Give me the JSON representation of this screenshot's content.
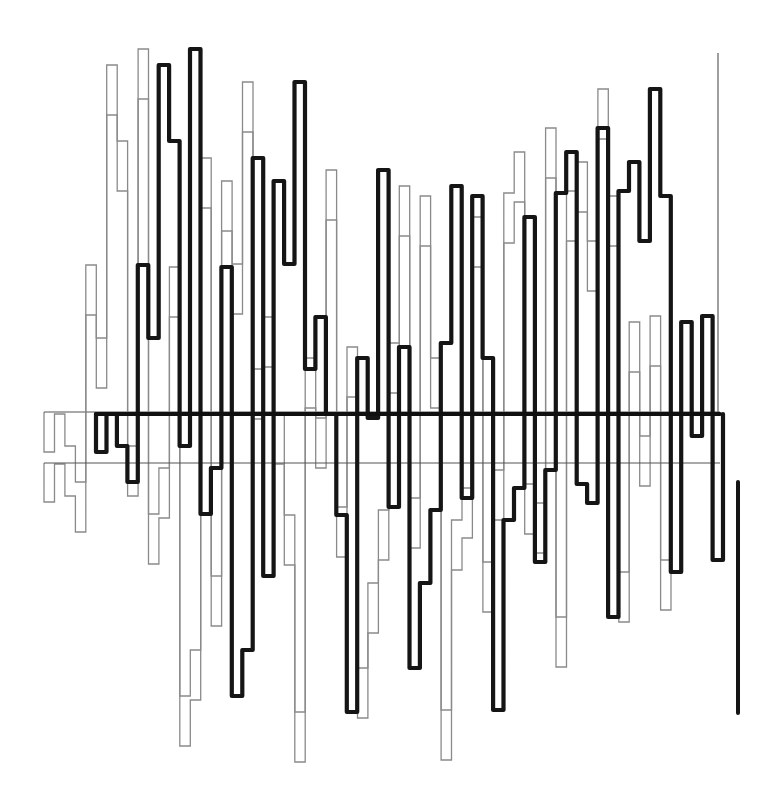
{
  "artwork": {
    "title": "",
    "background": "#ffffff",
    "colors": {
      "primary_trace": "#151515",
      "echo_trace": "#8a8a8a",
      "guide_line": "#6a6a6a"
    }
  },
  "chart_data": {
    "type": "line",
    "title": "",
    "xlabel": "",
    "ylabel": "",
    "grid": false,
    "legend": null,
    "step": true,
    "column_width_px": 10.45,
    "series": [
      {
        "name": "primary",
        "style": "thick-black",
        "x_start_px": 96,
        "baseline_y_px": 414,
        "end_x_px": 720,
        "values_y_px": [
          452,
          414,
          446,
          482,
          265,
          338,
          65,
          141,
          446,
          49,
          514,
          468,
          267,
          696,
          650,
          158,
          576,
          181,
          264,
          82,
          369,
          317,
          414,
          515,
          712,
          358,
          418,
          170,
          507,
          347,
          668,
          583,
          510,
          343,
          186,
          498,
          196,
          358,
          710,
          520,
          488,
          217,
          562,
          470,
          193,
          152,
          484,
          503,
          128,
          617,
          191,
          162,
          241,
          89,
          196,
          572,
          322,
          436,
          316,
          560
        ]
      },
      {
        "name": "echo-a",
        "style": "thin-gray",
        "x_start_px": 44,
        "baseline_y_px": 412,
        "x_shift_px": -52,
        "y_shift_px": 0,
        "end_x_px": 720
      },
      {
        "name": "echo-b",
        "style": "thin-gray",
        "x_start_px": 44,
        "baseline_y_px": 463,
        "x_shift_px": -52,
        "y_shift_px": 50,
        "end_x_px": 720
      }
    ],
    "extras": {
      "right_guide_line": {
        "x_px": 718,
        "y_top_px": 53,
        "y_bottom_px": 414
      },
      "tail_stroke": {
        "x_px": 738,
        "y_top_px": 482,
        "y_bottom_px": 713
      }
    }
  }
}
